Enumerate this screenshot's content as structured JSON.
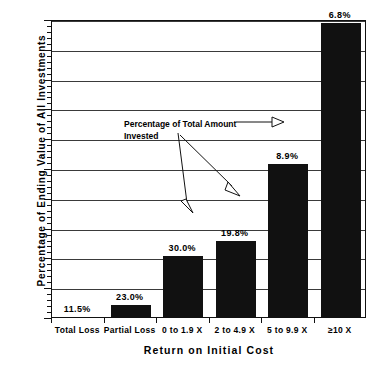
{
  "chart_data": {
    "type": "bar",
    "title": "",
    "xlabel": "Return on Initial Cost",
    "ylabel": "Percentage of Ending Value of All Investments",
    "ylim": [
      0,
      50
    ],
    "ytick_labels": [
      "0%",
      "5%",
      "10%",
      "15%",
      "20%",
      "25%",
      "30%",
      "35%",
      "40%",
      "45%",
      "50%"
    ],
    "ytick_values": [
      0,
      5,
      10,
      15,
      20,
      25,
      30,
      35,
      40,
      45,
      50
    ],
    "grid": true,
    "legend": "none",
    "categories": [
      "Total Loss",
      "Partial Loss",
      "0 to 1.9 X",
      "2 to 4.9 X",
      "5 to 9.9 X",
      "≥10 X"
    ],
    "values": [
      0.0,
      2.0,
      10.3,
      12.8,
      25.6,
      49.4
    ],
    "series": [
      {
        "name": "Percentage of Ending Value of All Investments",
        "values": [
          0.0,
          2.0,
          10.3,
          12.8,
          25.6,
          49.4
        ]
      }
    ],
    "data_labels": [
      "11.5%",
      "23.0%",
      "30.0%",
      "19.8%",
      "8.9%",
      "6.8%"
    ],
    "data_label_meaning": "Percentage of Total Amount Invested",
    "annotations": [
      {
        "text_line1": "Percentage of Total Amount",
        "text_line2": "Invested",
        "points_to": [
          "8.9%",
          "30.0%",
          "19.8%"
        ]
      }
    ]
  },
  "annotation": {
    "line1": "Percentage of Total Amount",
    "line2": "Invested"
  },
  "axes": {
    "x_title": "Return on Initial Cost",
    "y_title": "Percentage of Ending Value of All Investments"
  }
}
